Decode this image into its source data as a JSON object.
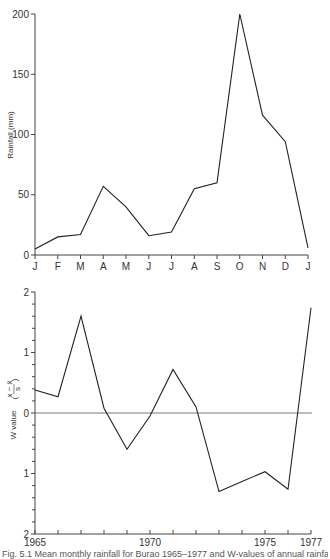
{
  "chart_data": [
    {
      "type": "line",
      "title": "",
      "xlabel": "",
      "ylabel": "Rainfall (mm)",
      "ylim": [
        0,
        200
      ],
      "yticks": [
        0,
        50,
        100,
        150,
        200
      ],
      "grid": false,
      "categories": [
        "J",
        "F",
        "M",
        "A",
        "M",
        "J",
        "J",
        "A",
        "S",
        "O",
        "N",
        "D",
        "J"
      ],
      "values": [
        5,
        15,
        17,
        57,
        40,
        16,
        19,
        55,
        60,
        200,
        116,
        94,
        6
      ]
    },
    {
      "type": "line",
      "title": "",
      "xlabel": "",
      "ylabel": "W value (x − x̄ / s)",
      "ylim": [
        -2,
        2
      ],
      "yticks": [
        2,
        1,
        0,
        1,
        2
      ],
      "grid": false,
      "reference_line": 0,
      "x": [
        1965,
        1966,
        1967,
        1968,
        1969,
        1970,
        1971,
        1972,
        1973,
        1974,
        1975,
        1976,
        1977
      ],
      "xtick_labels": [
        "1965",
        "1970",
        "1975",
        "1977"
      ],
      "values": [
        0.38,
        0.27,
        1.6,
        0.08,
        -0.6,
        -0.05,
        0.72,
        0.1,
        -1.3,
        -1.13,
        -0.97,
        -1.26,
        1.74
      ]
    }
  ],
  "top": {
    "ylabel": "Rainfall (mm)",
    "ytick_labels": [
      "0",
      "50",
      "100",
      "150",
      "200"
    ],
    "xtick_labels": [
      "J",
      "F",
      "M",
      "A",
      "M",
      "J",
      "J",
      "A",
      "S",
      "O",
      "N",
      "D",
      "J"
    ]
  },
  "bottom": {
    "ylabel": "W value",
    "formula_num": "x − x̄",
    "formula_den": "s",
    "ytick_labels": [
      "2",
      "1",
      "0",
      "1",
      "2"
    ],
    "xtick_labels": [
      "1965",
      "1970",
      "1975",
      "1977"
    ]
  },
  "caption": "Fig. 5.1 Mean monthly rainfall for Burao 1965–1977 and W-values of annual rainfall"
}
